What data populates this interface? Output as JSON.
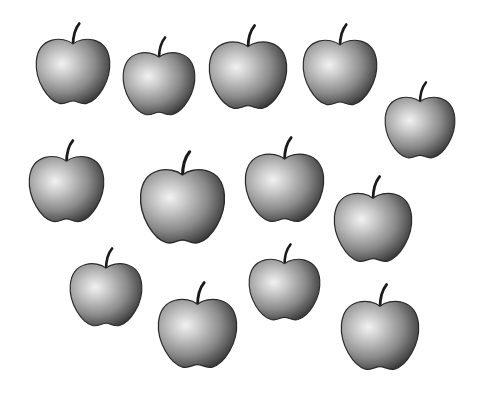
{
  "scene": {
    "description": "Twelve grayscale shaded apples with stems scattered on a white background",
    "background": "#ffffff",
    "apple_count": 12,
    "apples": [
      {
        "id": 1,
        "x": 34,
        "y": 22,
        "w": 78,
        "h": 86
      },
      {
        "id": 2,
        "x": 121,
        "y": 36,
        "w": 76,
        "h": 83
      },
      {
        "id": 3,
        "x": 207,
        "y": 24,
        "w": 82,
        "h": 89
      },
      {
        "id": 4,
        "x": 301,
        "y": 23,
        "w": 78,
        "h": 86
      },
      {
        "id": 5,
        "x": 383,
        "y": 81,
        "w": 74,
        "h": 81
      },
      {
        "id": 6,
        "x": 27,
        "y": 139,
        "w": 79,
        "h": 87
      },
      {
        "id": 7,
        "x": 138,
        "y": 150,
        "w": 89,
        "h": 98
      },
      {
        "id": 8,
        "x": 243,
        "y": 136,
        "w": 83,
        "h": 90
      },
      {
        "id": 9,
        "x": 332,
        "y": 175,
        "w": 82,
        "h": 91
      },
      {
        "id": 10,
        "x": 68,
        "y": 247,
        "w": 76,
        "h": 83
      },
      {
        "id": 11,
        "x": 247,
        "y": 243,
        "w": 75,
        "h": 81
      },
      {
        "id": 12,
        "x": 156,
        "y": 281,
        "w": 83,
        "h": 91
      },
      {
        "id": 13,
        "x": 339,
        "y": 283,
        "w": 82,
        "h": 91
      }
    ]
  }
}
